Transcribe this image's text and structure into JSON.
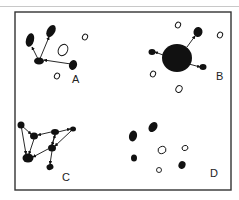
{
  "figure": {
    "panels": [
      {
        "id": "A",
        "label": "A",
        "label_pos": [
          72,
          83
        ],
        "filled_nodes": [
          {
            "x": 30,
            "y": 40,
            "rx": 4,
            "ry": 7,
            "rot": 15
          },
          {
            "x": 51,
            "y": 31,
            "rx": 4,
            "ry": 6.5,
            "rot": 30
          },
          {
            "x": 39,
            "y": 61,
            "rx": 5,
            "ry": 3.5,
            "rot": 0
          },
          {
            "x": 73,
            "y": 65,
            "rx": 4,
            "ry": 5,
            "rot": 20
          }
        ],
        "open_nodes": [
          {
            "x": 63,
            "y": 50,
            "rx": 4.5,
            "ry": 6,
            "rot": 30
          },
          {
            "x": 85,
            "y": 37,
            "rx": 2.5,
            "ry": 3,
            "rot": 30
          },
          {
            "x": 57,
            "y": 76,
            "rx": 2.5,
            "ry": 3,
            "rot": 30
          }
        ],
        "arrows": [
          {
            "from": [
              39,
              61
            ],
            "to": [
              32,
              47
            ]
          },
          {
            "from": [
              39,
              61
            ],
            "to": [
              49,
              37
            ]
          },
          {
            "from": [
              71,
              64
            ],
            "to": [
              44,
              60
            ]
          }
        ]
      },
      {
        "id": "B",
        "label": "B",
        "label_pos": [
          216,
          80
        ],
        "filled_nodes": [
          {
            "x": 177,
            "y": 58,
            "rx": 15,
            "ry": 14,
            "rot": 0
          },
          {
            "x": 198,
            "y": 32,
            "rx": 4.5,
            "ry": 5,
            "rot": 10
          },
          {
            "x": 152,
            "y": 52,
            "rx": 3.5,
            "ry": 3,
            "rot": 0
          },
          {
            "x": 203,
            "y": 67,
            "rx": 3.5,
            "ry": 3,
            "rot": 0
          }
        ],
        "open_nodes": [
          {
            "x": 178,
            "y": 25,
            "rx": 2.5,
            "ry": 3,
            "rot": 30
          },
          {
            "x": 220,
            "y": 35,
            "rx": 2.5,
            "ry": 3,
            "rot": 30
          },
          {
            "x": 153,
            "y": 74,
            "rx": 2.5,
            "ry": 3,
            "rot": 30
          },
          {
            "x": 179,
            "y": 89,
            "rx": 3,
            "ry": 3.5,
            "rot": 30
          }
        ],
        "arrows": [
          {
            "from": [
              187,
              47
            ],
            "to": [
              195,
              36
            ]
          },
          {
            "from": [
              163,
              55
            ],
            "to": [
              155,
              52
            ]
          },
          {
            "from": [
              189,
              64
            ],
            "to": [
              200,
              67
            ]
          }
        ]
      },
      {
        "id": "C",
        "label": "C",
        "label_pos": [
          62,
          181
        ],
        "filled_nodes": [
          {
            "x": 21,
            "y": 125,
            "rx": 3.5,
            "ry": 3.5,
            "rot": 0
          },
          {
            "x": 34,
            "y": 136,
            "rx": 4,
            "ry": 3.5,
            "rot": 0
          },
          {
            "x": 55,
            "y": 132,
            "rx": 4,
            "ry": 3,
            "rot": 0
          },
          {
            "x": 73,
            "y": 129,
            "rx": 3,
            "ry": 2.5,
            "rot": 0
          },
          {
            "x": 52,
            "y": 148,
            "rx": 4,
            "ry": 3.5,
            "rot": 0
          },
          {
            "x": 28,
            "y": 158,
            "rx": 5.5,
            "ry": 4.5,
            "rot": 0
          },
          {
            "x": 50,
            "y": 167,
            "rx": 3.5,
            "ry": 3,
            "rot": -20
          }
        ],
        "open_nodes": [],
        "arrows": [
          {
            "from": [
              21,
              125
            ],
            "to": [
              31,
              134
            ]
          },
          {
            "from": [
              21,
              125
            ],
            "to": [
              26,
              154
            ]
          },
          {
            "from": [
              51,
              132
            ],
            "to": [
              38,
              135
            ]
          },
          {
            "from": [
              58,
              132
            ],
            "to": [
              70,
              129
            ]
          },
          {
            "from": [
              71,
              131
            ],
            "to": [
              55,
              146
            ]
          },
          {
            "from": [
              55,
              135
            ],
            "to": [
              52,
              145
            ]
          },
          {
            "from": [
              34,
              139
            ],
            "to": [
              29,
              154
            ]
          },
          {
            "from": [
              48,
              149
            ],
            "to": [
              33,
              157
            ]
          },
          {
            "from": [
              52,
              151
            ],
            "to": [
              50,
              164
            ]
          },
          {
            "from": [
              52,
              145
            ],
            "to": [
              55,
              135
            ]
          }
        ]
      },
      {
        "id": "D",
        "label": "D",
        "label_pos": [
          210,
          177
        ],
        "filled_nodes": [
          {
            "x": 133,
            "y": 136,
            "rx": 4,
            "ry": 5.5,
            "rot": 15
          },
          {
            "x": 153,
            "y": 127,
            "rx": 4,
            "ry": 5.5,
            "rot": 35
          },
          {
            "x": 134,
            "y": 158,
            "rx": 3,
            "ry": 3.5,
            "rot": 0
          },
          {
            "x": 182,
            "y": 165,
            "rx": 3.5,
            "ry": 4,
            "rot": 20
          }
        ],
        "open_nodes": [
          {
            "x": 162,
            "y": 150,
            "rx": 4,
            "ry": 3.5,
            "rot": -20
          },
          {
            "x": 185,
            "y": 148,
            "rx": 3,
            "ry": 2.5,
            "rot": -20
          },
          {
            "x": 159,
            "y": 170,
            "rx": 2.5,
            "ry": 2.5,
            "rot": 0
          }
        ],
        "arrows": []
      }
    ],
    "frame": {
      "x": 15,
      "y": 12,
      "width": 216,
      "height": 178
    },
    "colors": {
      "ink": "#111111",
      "frame": "#333333",
      "background": "#ffffff"
    }
  }
}
